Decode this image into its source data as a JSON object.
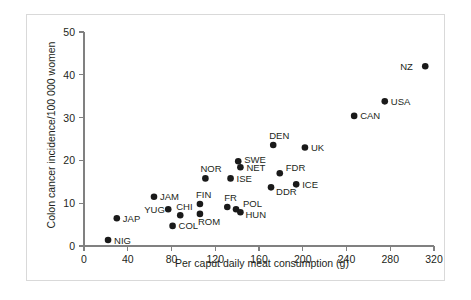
{
  "chart_data": {
    "type": "scatter",
    "title": "",
    "xlabel": "Per caput daily meat consumption (g)",
    "ylabel": "Colon cancer incidence/100 000 women",
    "xlim": [
      0,
      320
    ],
    "ylim": [
      0,
      50
    ],
    "xticks": [
      "0",
      "40",
      "80",
      "120",
      "160",
      "200",
      "240",
      "280",
      "320"
    ],
    "yticks": [
      "0",
      "10",
      "20",
      "30",
      "40",
      "50"
    ],
    "grid": false,
    "legend": "none",
    "points": [
      {
        "label": "NIG",
        "x": 22,
        "y": 1.4,
        "lx": 6,
        "ly": 3.5
      },
      {
        "label": "JAP",
        "x": 30,
        "y": 6.5,
        "lx": 6,
        "ly": 3.5
      },
      {
        "label": "COL",
        "x": 81,
        "y": 4.7,
        "lx": 6,
        "ly": 3.5
      },
      {
        "label": "CHI",
        "x": 88,
        "y": 7.2,
        "lx": -4,
        "ly": -5
      },
      {
        "label": "YUG",
        "x": 77,
        "y": 8.6,
        "lx": -24,
        "ly": 3.5
      },
      {
        "label": "JAM",
        "x": 64,
        "y": 11.5,
        "lx": 6,
        "ly": 3.5
      },
      {
        "label": "ROM",
        "x": 106,
        "y": 7.5,
        "lx": -2,
        "ly": 11
      },
      {
        "label": "FIN",
        "x": 106,
        "y": 9.8,
        "lx": -4,
        "ly": -6
      },
      {
        "label": "HUN",
        "x": 143,
        "y": 7.9,
        "lx": 5,
        "ly": 6
      },
      {
        "label": "POL",
        "x": 139,
        "y": 8.6,
        "lx": 7,
        "ly": -2
      },
      {
        "label": "FR",
        "x": 131,
        "y": 9.1,
        "lx": -3,
        "ly": -6
      },
      {
        "label": "DDR",
        "x": 171,
        "y": 13.7,
        "lx": 5,
        "ly": 8
      },
      {
        "label": "ICE",
        "x": 194,
        "y": 14.4,
        "lx": 6,
        "ly": 3.5
      },
      {
        "label": "NOR",
        "x": 111,
        "y": 15.8,
        "lx": -5,
        "ly": -6
      },
      {
        "label": "ISE",
        "x": 134,
        "y": 15.8,
        "lx": 6,
        "ly": 3.5
      },
      {
        "label": "FDR",
        "x": 179,
        "y": 17.0,
        "lx": 6,
        "ly": -2
      },
      {
        "label": "NET",
        "x": 143,
        "y": 18.4,
        "lx": 6,
        "ly": 3.5
      },
      {
        "label": "SWE",
        "x": 141,
        "y": 19.8,
        "lx": 6,
        "ly": 2
      },
      {
        "label": "UK",
        "x": 202,
        "y": 23.0,
        "lx": 6,
        "ly": 3.5
      },
      {
        "label": "DEN",
        "x": 173,
        "y": 23.6,
        "lx": -4,
        "ly": -6
      },
      {
        "label": "CAN",
        "x": 247,
        "y": 30.4,
        "lx": 6,
        "ly": 3.5
      },
      {
        "label": "USA",
        "x": 275,
        "y": 33.8,
        "lx": 6,
        "ly": 3.5
      },
      {
        "label": "NZ",
        "x": 312,
        "y": 42.0,
        "lx": -25,
        "ly": 3.5
      }
    ]
  }
}
